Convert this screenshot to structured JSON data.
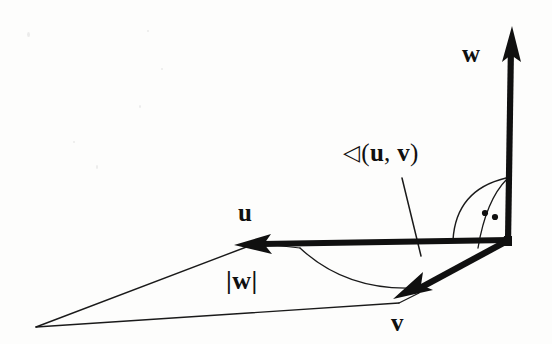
{
  "figure": {
    "background_color": "#fdfdfc",
    "stroke_color": "#101010",
    "width": 552,
    "height": 344
  },
  "labels": {
    "w": "w",
    "u": "u",
    "v": "v",
    "magnitude_w": "|w|",
    "angle_symbol": "◁",
    "angle_open": "(",
    "angle_u": "u",
    "angle_comma": ",",
    "angle_v": "v",
    "angle_close": ")"
  },
  "geometry": {
    "origin": {
      "x": 507,
      "y": 239
    },
    "u_vector": {
      "from_x": 507,
      "from_y": 240,
      "to_x": 236,
      "to_y": 245
    },
    "v_vector": {
      "from_x": 506,
      "from_y": 240,
      "to_x": 394,
      "to_y": 298
    },
    "w_vector": {
      "from_x": 508,
      "from_y": 240,
      "to_x": 512,
      "to_y": 27
    },
    "triangle_apex": {
      "x": 36,
      "y": 327
    },
    "leader_line": {
      "from_x": 402,
      "from_y": 178,
      "to_x": 421,
      "to_y": 256
    },
    "right_angle_dots": [
      {
        "x": 485,
        "y": 213
      },
      {
        "x": 495,
        "y": 217
      }
    ]
  }
}
